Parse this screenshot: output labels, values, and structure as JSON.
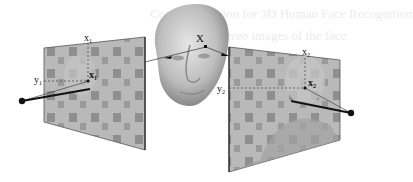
{
  "figure": {
    "background": "#ffffff",
    "bleed_text": {
      "line1": "Computer Vision for 3D Human Face Recognition",
      "line2": "Stereo images of the face"
    },
    "object": {
      "name": "3D face model",
      "point_label": "X"
    },
    "left_view": {
      "image_label": "x",
      "image_subscript": "1",
      "axis_x_label": "x",
      "axis_x_subscript": "1",
      "axis_y_label": "y",
      "axis_y_subscript": "1"
    },
    "right_view": {
      "image_label": "x",
      "image_subscript": "2",
      "axis_x_label": "x",
      "axis_x_subscript": "2",
      "axis_y_label": "y",
      "axis_y_subscript": "2"
    },
    "colors": {
      "panel_fill": "#b8b8b8",
      "patch_dark": "#8e8e8e",
      "face_fill": "#c9c9c9",
      "line": "#111111"
    }
  }
}
